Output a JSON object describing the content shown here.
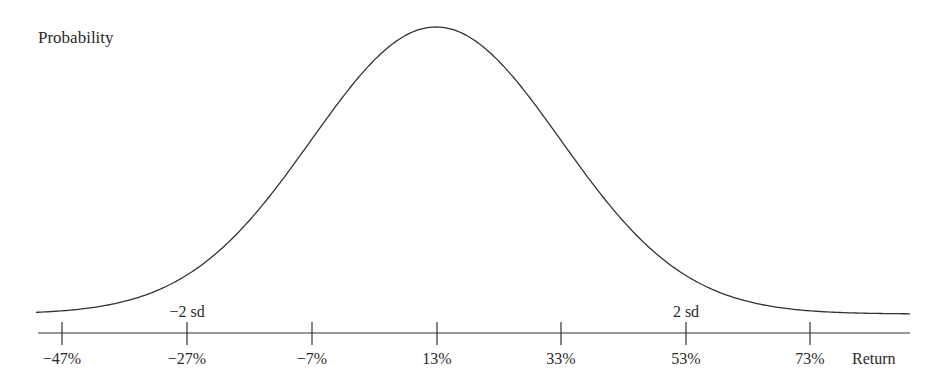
{
  "chart_data": {
    "type": "line",
    "title": "",
    "ylabel": "Probability",
    "xlabel": "Return",
    "distribution": "normal",
    "mean_pct": 13,
    "sd_pct": 20,
    "x_ticks": [
      -47,
      -27,
      -7,
      13,
      33,
      53,
      73
    ],
    "x_tick_labels": [
      "−47%",
      "−27%",
      "−7%",
      "13%",
      "33%",
      "53%",
      "73%"
    ],
    "annotations": [
      {
        "label": "−2 sd",
        "at": -27
      },
      {
        "label": "2 sd",
        "at": 53
      }
    ],
    "xlim": [
      -57,
      83
    ],
    "grid": false,
    "legend": "none"
  },
  "labels": {
    "y_axis": "Probability",
    "x_axis": "Return",
    "minus_2sd": "−2 sd",
    "plus_2sd": "2 sd",
    "ticks": [
      "−47%",
      "−27%",
      "−7%",
      "13%",
      "33%",
      "53%",
      "73%"
    ]
  },
  "colors": {
    "line": "#333333",
    "text": "#2a2a2a",
    "background": "#ffffff"
  }
}
